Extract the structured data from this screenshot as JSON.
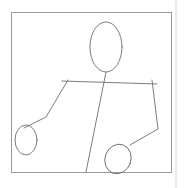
{
  "canvas": {
    "border_color": "#9a9a9a",
    "stroke_color": "#6e6e6e",
    "background": "#ffffff"
  },
  "drawing": {
    "subject": "stick-figure",
    "shapes": [
      {
        "name": "head",
        "type": "ellipse",
        "cx": 106,
        "cy": 47,
        "rx": 16,
        "ry": 25
      },
      {
        "name": "shoulders",
        "type": "line",
        "points": [
          [
            62,
            81
          ],
          [
            157,
            84
          ]
        ]
      },
      {
        "name": "body",
        "type": "line",
        "points": [
          [
            106,
            72
          ],
          [
            86,
            172
          ]
        ]
      },
      {
        "name": "left-arm",
        "type": "polyline",
        "points": [
          [
            68,
            80
          ],
          [
            46,
            117
          ],
          [
            24,
            128
          ]
        ]
      },
      {
        "name": "left-hand",
        "type": "ellipse",
        "cx": 26,
        "cy": 140,
        "rx": 11,
        "ry": 15
      },
      {
        "name": "right-arm",
        "type": "polyline",
        "points": [
          [
            152,
            80
          ],
          [
            158,
            129
          ],
          [
            130,
            145
          ]
        ]
      },
      {
        "name": "right-hand",
        "type": "ellipse",
        "cx": 118,
        "cy": 159,
        "rx": 13,
        "ry": 15
      }
    ]
  }
}
